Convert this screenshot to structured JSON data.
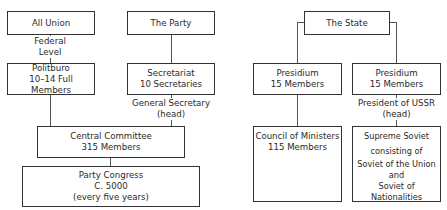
{
  "party_side": {
    "all_union": {
      "title": "All Union"
    },
    "federal_label": {
      "line1": "Federal",
      "line2": "Level"
    },
    "politburo": {
      "title": "Politburo",
      "subtitle": "10–14 Full Members"
    },
    "the_party": {
      "title": "The Party"
    },
    "secretariat": {
      "title": "Secretariat",
      "subtitle": "10 Secretaries"
    },
    "general_secretary_label": {
      "line1": "General Secretary",
      "line2": "(head)"
    },
    "central_committee": {
      "title": "Central Committee",
      "subtitle": "315 Members"
    },
    "party_congress": {
      "title": "Party Congress",
      "subtitle": "C. 5000",
      "note": "(every five years)"
    }
  },
  "state_side": {
    "the_state": {
      "title": "The State"
    },
    "presidium_left": {
      "title": "Presidium",
      "subtitle": "15 Members"
    },
    "presidium_right": {
      "title": "Presidium",
      "subtitle": "15 Members"
    },
    "president_label": {
      "line1": "President of USSR",
      "line2": "(head)"
    },
    "council_of_ministers": {
      "title": "Council of Ministers",
      "subtitle": "115 Members"
    },
    "supreme_soviet": {
      "title": "Supreme Soviet",
      "line2": "consisting of",
      "line3": "Soviet of the Union",
      "line4": "and",
      "line5": "Soviet of Nationalities"
    }
  }
}
